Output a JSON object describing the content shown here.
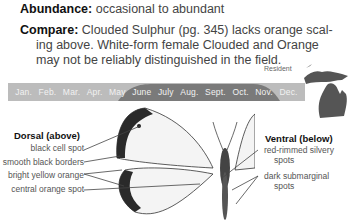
{
  "abundance": {
    "label": "Abundance:",
    "value": "occasional to abundant"
  },
  "compare": {
    "label": "Compare:",
    "line1": "Clouded Sulphur (pg. 345) lacks orange scal-",
    "line2": "ing above. White-form female Clouded and Orange",
    "line3": "may not be reliably distinguished in the field."
  },
  "range": {
    "status": "Resident",
    "map_icon": "michigan-map-icon",
    "map_color": "#555555"
  },
  "flight_period": {
    "months": [
      "Jan.",
      "Feb.",
      "Mar.",
      "Apr.",
      "May",
      "June",
      "July",
      "Aug.",
      "Sept.",
      "Oct.",
      "Nov.",
      "Dec."
    ],
    "active_start": "May",
    "active_end": "Nov.",
    "bar_color": "#bcbcbc",
    "active_color": "#7a7a7a"
  },
  "dorsal": {
    "heading": "Dorsal (above)",
    "labels": [
      "black cell spot",
      "smooth black borders",
      "bright yellow orange",
      "central orange spot"
    ]
  },
  "ventral": {
    "heading": "Ventral (below)",
    "labels": [
      {
        "line1": "red-rimmed silvery",
        "line2": "spots"
      },
      {
        "line1": "dark submarginal",
        "line2": "spots"
      }
    ]
  }
}
